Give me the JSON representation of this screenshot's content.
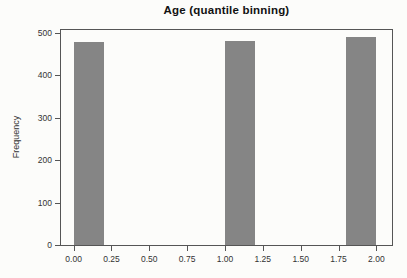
{
  "chart_data": {
    "type": "bar",
    "chart_kind": "histogram",
    "title": "Age (quantile binning)",
    "xlabel": "",
    "ylabel": "Frequency",
    "xlim": [
      -0.09,
      2.11
    ],
    "ylim": [
      0,
      512
    ],
    "grid": false,
    "legend": null,
    "bar_color": "#858585",
    "axis_color": "#555555",
    "tick_text_color": "#333333",
    "title_color": "#111111",
    "background_color": "#fcfcfa",
    "xticks": [
      {
        "value": 0,
        "label": "0.00"
      },
      {
        "value": 0.25,
        "label": "0.25"
      },
      {
        "value": 0.5,
        "label": "0.50"
      },
      {
        "value": 0.75,
        "label": "0.75"
      },
      {
        "value": 1,
        "label": "1.00"
      },
      {
        "value": 1.25,
        "label": "1.25"
      },
      {
        "value": 1.5,
        "label": "1.50"
      },
      {
        "value": 1.75,
        "label": "1.75"
      },
      {
        "value": 2,
        "label": "2.00"
      }
    ],
    "yticks": [
      {
        "value": 0,
        "label": "0"
      },
      {
        "value": 100,
        "label": "100"
      },
      {
        "value": 200,
        "label": "200"
      },
      {
        "value": 300,
        "label": "300"
      },
      {
        "value": 400,
        "label": "400"
      },
      {
        "value": 500,
        "label": "500"
      }
    ],
    "bars": [
      {
        "x_start": 0.0,
        "x_end": 0.2,
        "count": 478
      },
      {
        "x_start": 1.0,
        "x_end": 1.2,
        "count": 481
      },
      {
        "x_start": 1.8,
        "x_end": 2.0,
        "count": 491
      }
    ]
  }
}
